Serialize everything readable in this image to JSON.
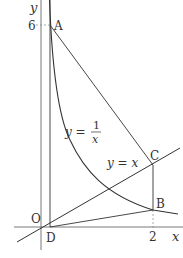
{
  "diagram": {
    "type": "coordinate-geometry",
    "axes": {
      "x_label": "x",
      "y_label": "y",
      "origin_label": "O",
      "x_tick": "2",
      "y_tick": "6"
    },
    "curves": [
      {
        "name": "hyperbola",
        "label_lhs": "y =",
        "label_num": "1",
        "label_den": "x",
        "equation": "y = 1/x"
      },
      {
        "name": "line",
        "label": "y = x",
        "equation": "y = x"
      }
    ],
    "points": {
      "A": {
        "label": "A",
        "coords": "(1/6, 6)"
      },
      "B": {
        "label": "B",
        "coords": "(2, 1/2)"
      },
      "C": {
        "label": "C",
        "coords": "(2, 2)"
      },
      "D": {
        "label": "D",
        "coords": "(1/6, 0)"
      }
    },
    "colors": {
      "stroke": "#333333",
      "axis": "#555555",
      "guide": "#888888",
      "background": "#ffffff"
    }
  }
}
